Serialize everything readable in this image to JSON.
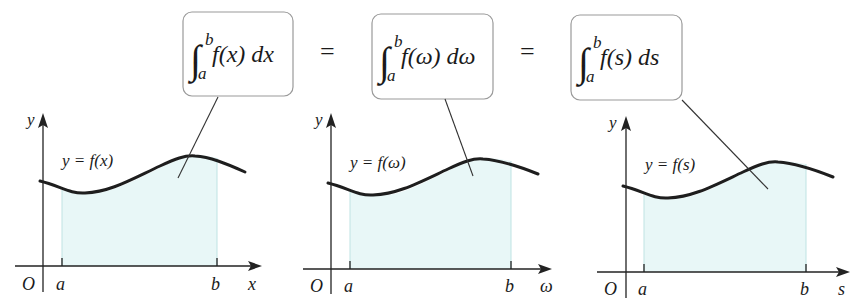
{
  "formulas": [
    {
      "integral": "∫",
      "upper": "b",
      "lower": "a",
      "body": "f(x) dx"
    },
    {
      "integral": "∫",
      "upper": "b",
      "lower": "a",
      "body": "f(ω) dω"
    },
    {
      "integral": "∫",
      "upper": "b",
      "lower": "a",
      "body": "f(s) ds"
    }
  ],
  "equals": [
    "=",
    "="
  ],
  "panels": [
    {
      "curve_label": "y = f(x)",
      "y_axis": "y",
      "x_axis": "x",
      "origin": "O",
      "a": "a",
      "b": "b"
    },
    {
      "curve_label": "y = f(ω)",
      "y_axis": "y",
      "x_axis": "ω",
      "origin": "O",
      "a": "a",
      "b": "b"
    },
    {
      "curve_label": "y = f(s)",
      "y_axis": "y",
      "x_axis": "s",
      "origin": "O",
      "a": "a",
      "b": "b"
    }
  ],
  "colors": {
    "shade": "#e8f7f7",
    "curve": "#1e1e1e",
    "box_border": "#9a9a9a"
  }
}
